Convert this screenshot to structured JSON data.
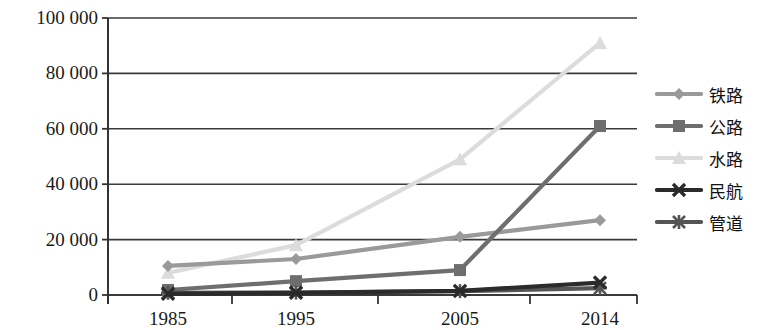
{
  "chart_data": {
    "type": "line",
    "title": "",
    "xlabel": "",
    "ylabel": "",
    "categories": [
      "1985",
      "1995",
      "2005",
      "2014"
    ],
    "x_tick_labels": [
      "1985",
      "1995",
      "2005",
      "2014"
    ],
    "y_tick_labels": [
      "0",
      "20 000",
      "40 000",
      "60 000",
      "80 000",
      "100 000"
    ],
    "y_tick_values": [
      0,
      20000,
      40000,
      60000,
      80000,
      100000
    ],
    "ylim": [
      0,
      100000
    ],
    "grid": "horizontal",
    "legend_position": "right",
    "series": [
      {
        "name": "铁路",
        "marker": "diamond",
        "color": "#9a9a9a",
        "values": [
          10500,
          13000,
          21000,
          27000
        ]
      },
      {
        "name": "公路",
        "marker": "square",
        "color": "#6e6e6e",
        "values": [
          1800,
          5000,
          9000,
          61000
        ]
      },
      {
        "name": "水路",
        "marker": "triangle",
        "color": "#dcdcdc",
        "values": [
          8000,
          18000,
          49000,
          91000
        ]
      },
      {
        "name": "民航",
        "marker": "cross",
        "color": "#2b2b2b",
        "values": [
          400,
          800,
          1500,
          4500
        ]
      },
      {
        "name": "管道",
        "marker": "asterisk",
        "color": "#555555",
        "values": [
          800,
          900,
          1400,
          2500
        ]
      }
    ]
  },
  "legend": {
    "items": [
      {
        "label": "铁路",
        "marker": "diamond",
        "color": "#9a9a9a"
      },
      {
        "label": "公路",
        "marker": "square",
        "color": "#6e6e6e"
      },
      {
        "label": "水路",
        "marker": "triangle",
        "color": "#dcdcdc"
      },
      {
        "label": "民航",
        "marker": "cross",
        "color": "#2b2b2b"
      },
      {
        "label": "管道",
        "marker": "asterisk",
        "color": "#555555"
      }
    ]
  },
  "axes": {
    "axis_color": "#333333",
    "grid_color": "#3a3a3a"
  }
}
